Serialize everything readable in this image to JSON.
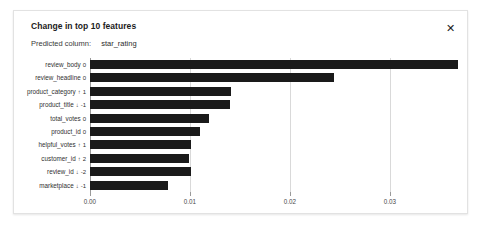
{
  "panel": {
    "title": "Change in top 10 features",
    "close_icon": "close-icon",
    "close_glyph": "✕",
    "subtitle_label": "Predicted column:",
    "subtitle_value": "star_rating",
    "border_color": "#e2e2e2",
    "background_color": "#ffffff"
  },
  "chart_data": {
    "type": "bar",
    "orientation": "horizontal",
    "title": "Change in top 10 features",
    "xlabel": "",
    "ylabel": "",
    "xlim": [
      0.0,
      0.031
    ],
    "grid": true,
    "legend": null,
    "bar_color": "#1a1a1a",
    "xticks": [
      0.0,
      0.01,
      0.02,
      0.03
    ],
    "xticklabels": [
      "0.00",
      "0.01",
      "0.02",
      "0.03"
    ],
    "categories": [
      "review_body",
      "review_headline",
      "product_category",
      "product_title",
      "total_votes",
      "product_id",
      "helpful_votes",
      "customer_id",
      "review_id",
      "marketplace"
    ],
    "values": [
      0.0368,
      0.0244,
      0.0141,
      0.014,
      0.0119,
      0.011,
      0.0101,
      0.0099,
      0.0101,
      0.0078
    ],
    "rank_arrows": [
      "",
      "",
      "↑",
      "↓",
      "",
      "",
      "↑",
      "↑",
      "↓",
      "↓"
    ],
    "rank_deltas": [
      "0",
      "0",
      "1",
      "-1",
      "0",
      "0",
      "1",
      "2",
      "-2",
      "-1"
    ],
    "rows": [
      {
        "label": "review_body",
        "arrow": "",
        "delta": "0",
        "value": 0.0368
      },
      {
        "label": "review_headline",
        "arrow": "",
        "delta": "0",
        "value": 0.0244
      },
      {
        "label": "product_category",
        "arrow": "↑",
        "delta": "1",
        "value": 0.0141
      },
      {
        "label": "product_title",
        "arrow": "↓",
        "delta": "-1",
        "value": 0.014
      },
      {
        "label": "total_votes",
        "arrow": "",
        "delta": "0",
        "value": 0.0119
      },
      {
        "label": "product_id",
        "arrow": "",
        "delta": "0",
        "value": 0.011
      },
      {
        "label": "helpful_votes",
        "arrow": "↑",
        "delta": "1",
        "value": 0.0101
      },
      {
        "label": "customer_id",
        "arrow": "↑",
        "delta": "2",
        "value": 0.0099
      },
      {
        "label": "review_id",
        "arrow": "↓",
        "delta": "-2",
        "value": 0.0101
      },
      {
        "label": "marketplace",
        "arrow": "↓",
        "delta": "-1",
        "value": 0.0078
      }
    ]
  }
}
